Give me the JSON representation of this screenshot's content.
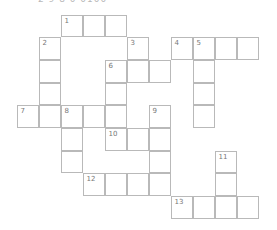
{
  "header": {
    "clipped_text": "2 9 8     0 0100"
  },
  "grid": {
    "origin_x": 17,
    "origin_y": 15,
    "cell_w": 22,
    "cell_h": 22.7,
    "cells": [
      {
        "r": 0,
        "c": 2,
        "n": "1"
      },
      {
        "r": 0,
        "c": 3
      },
      {
        "r": 0,
        "c": 4
      },
      {
        "r": 1,
        "c": 1,
        "n": "2"
      },
      {
        "r": 1,
        "c": 5,
        "n": "3"
      },
      {
        "r": 1,
        "c": 7,
        "n": "4"
      },
      {
        "r": 1,
        "c": 8,
        "n": "5"
      },
      {
        "r": 1,
        "c": 9
      },
      {
        "r": 1,
        "c": 10
      },
      {
        "r": 2,
        "c": 1
      },
      {
        "r": 2,
        "c": 4,
        "n": "6"
      },
      {
        "r": 2,
        "c": 5
      },
      {
        "r": 2,
        "c": 6
      },
      {
        "r": 2,
        "c": 8
      },
      {
        "r": 3,
        "c": 1
      },
      {
        "r": 3,
        "c": 4
      },
      {
        "r": 3,
        "c": 8
      },
      {
        "r": 4,
        "c": 0,
        "n": "7"
      },
      {
        "r": 4,
        "c": 1
      },
      {
        "r": 4,
        "c": 2,
        "n": "8"
      },
      {
        "r": 4,
        "c": 3
      },
      {
        "r": 4,
        "c": 4
      },
      {
        "r": 4,
        "c": 6,
        "n": "9"
      },
      {
        "r": 4,
        "c": 8
      },
      {
        "r": 5,
        "c": 2
      },
      {
        "r": 5,
        "c": 4,
        "n": "10"
      },
      {
        "r": 5,
        "c": 5
      },
      {
        "r": 5,
        "c": 6
      },
      {
        "r": 6,
        "c": 2
      },
      {
        "r": 6,
        "c": 6
      },
      {
        "r": 6,
        "c": 9,
        "n": "11"
      },
      {
        "r": 7,
        "c": 3,
        "n": "12"
      },
      {
        "r": 7,
        "c": 4
      },
      {
        "r": 7,
        "c": 5
      },
      {
        "r": 7,
        "c": 6
      },
      {
        "r": 7,
        "c": 9
      },
      {
        "r": 8,
        "c": 7,
        "n": "13"
      },
      {
        "r": 8,
        "c": 8
      },
      {
        "r": 8,
        "c": 9
      },
      {
        "r": 8,
        "c": 10
      }
    ]
  },
  "colors": {
    "border": "#b9b9b9",
    "number": "#777777",
    "background": "#ffffff"
  }
}
